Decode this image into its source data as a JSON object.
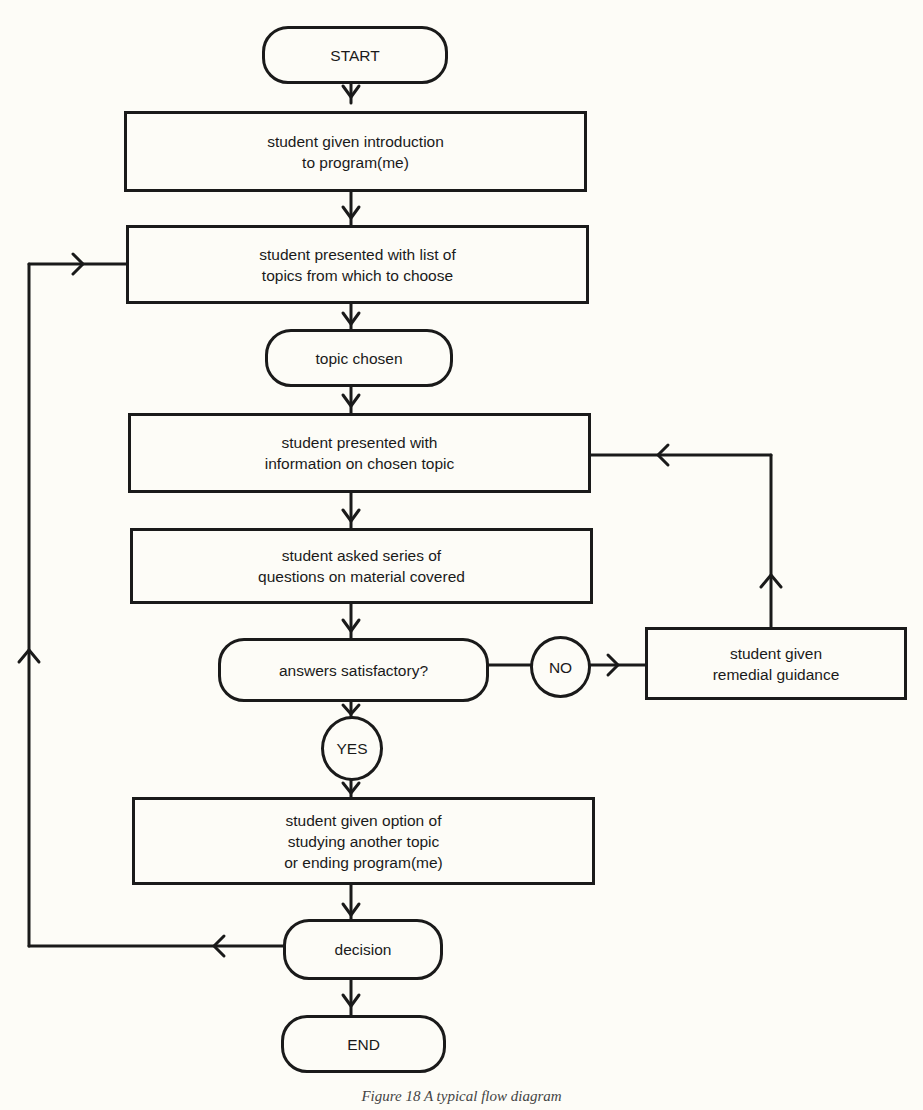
{
  "diagram": {
    "type": "flowchart",
    "nodes": {
      "start": "START",
      "intro": "student given introduction\nto program(me)",
      "topics": "student presented with list of\ntopics from which to choose",
      "chosen": "topic chosen",
      "info": "student presented with\ninformation on chosen topic",
      "questions": "student asked series of\nquestions on material covered",
      "satisfactory": "answers satisfactory?",
      "no": "NO",
      "remedial": "student given\nremedial guidance",
      "yes": "YES",
      "option": "student given option of\nstudying another topic\nor ending program(me)",
      "decision": "decision",
      "end": "END"
    },
    "edges": [
      {
        "from": "start",
        "to": "intro"
      },
      {
        "from": "intro",
        "to": "topics"
      },
      {
        "from": "topics",
        "to": "chosen"
      },
      {
        "from": "chosen",
        "to": "info"
      },
      {
        "from": "info",
        "to": "questions"
      },
      {
        "from": "questions",
        "to": "satisfactory"
      },
      {
        "from": "satisfactory",
        "to": "remedial",
        "label": "NO"
      },
      {
        "from": "remedial",
        "to": "info"
      },
      {
        "from": "satisfactory",
        "to": "option",
        "label": "YES"
      },
      {
        "from": "option",
        "to": "decision"
      },
      {
        "from": "decision",
        "to": "topics"
      },
      {
        "from": "decision",
        "to": "end"
      }
    ],
    "caption": "Figure 18  A typical flow diagram"
  }
}
